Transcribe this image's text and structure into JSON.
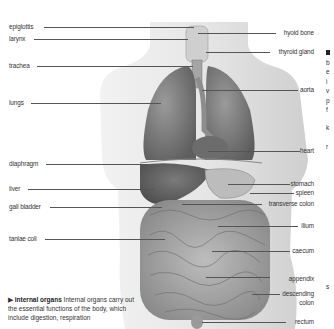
{
  "diagram": {
    "title": "internal organs",
    "labels_left": [
      {
        "text": "epiglottis",
        "x": 9,
        "y": 26,
        "line_to": 150
      },
      {
        "text": "larynx",
        "x": 9,
        "y": 38,
        "line_to": 178
      },
      {
        "text": "trachea",
        "x": 9,
        "y": 63,
        "line_to": 185
      },
      {
        "text": "lungs",
        "x": 9,
        "y": 100,
        "line_to": 158
      },
      {
        "text": "diaphragm",
        "x": 9,
        "y": 162,
        "line_to": 148
      },
      {
        "text": "liver",
        "x": 9,
        "y": 186,
        "line_to": 152
      },
      {
        "text": "gall bladder",
        "x": 9,
        "y": 205,
        "line_to": 160
      },
      {
        "text": "taniae coli",
        "x": 9,
        "y": 236,
        "line_to": 165
      }
    ],
    "labels_right": [
      {
        "text": "hyoid bone",
        "x_right": 314,
        "y": 31,
        "line_from": 190
      },
      {
        "text": "thyroid gland",
        "x_right": 314,
        "y": 50,
        "line_from": 200
      },
      {
        "text": "aorta",
        "x_right": 314,
        "y": 87,
        "line_from": 200
      },
      {
        "text": "heart",
        "x_right": 314,
        "y": 148,
        "line_from": 205
      },
      {
        "text": "stomach",
        "x_right": 314,
        "y": 182,
        "line_from": 225
      },
      {
        "text": "spleen",
        "x_right": 314,
        "y": 191,
        "line_from": 248
      },
      {
        "text": "transverse colon",
        "x_right": 314,
        "y": 201,
        "line_from": 180
      },
      {
        "text": "ilium",
        "x_right": 314,
        "y": 225,
        "line_from": 215
      },
      {
        "text": "caecum",
        "x_right": 314,
        "y": 250,
        "line_from": 210
      },
      {
        "text": "appendix",
        "x_right": 314,
        "y": 278,
        "line_from": 205
      },
      {
        "text": "descending",
        "x_right": 314,
        "y": 293,
        "line_from": 250
      },
      {
        "text": "colon",
        "x_right": 314,
        "y": 302,
        "line_from": null
      },
      {
        "text": "rectum",
        "x_right": 314,
        "y": 322,
        "line_from": 200
      }
    ],
    "caption": {
      "heading": "internal organs",
      "text": " Internal organs carry out the essential functions of the body, which include digestion, respiration"
    },
    "right_edge_fragments": [
      "b",
      "e",
      "i",
      "v",
      "p",
      "f",
      "",
      "k",
      "",
      "r"
    ],
    "right_edge_fragment_s": "s"
  }
}
